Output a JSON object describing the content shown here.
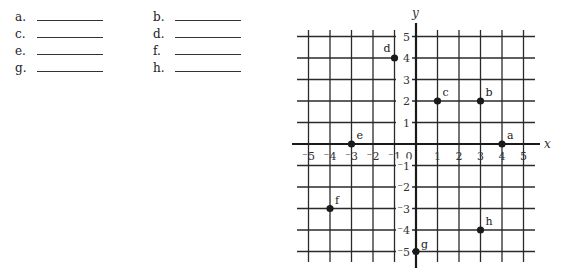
{
  "answers": [
    {
      "label": "a.",
      "value": ""
    },
    {
      "label": "b.",
      "value": ""
    },
    {
      "label": "c.",
      "value": ""
    },
    {
      "label": "d.",
      "value": ""
    },
    {
      "label": "e.",
      "value": ""
    },
    {
      "label": "f.",
      "value": ""
    },
    {
      "label": "g.",
      "value": ""
    },
    {
      "label": "h.",
      "value": ""
    }
  ],
  "graph": {
    "x_axis_label": "x",
    "y_axis_label": "y",
    "origin_label": "0",
    "x_ticks": [
      "⁻5",
      "⁻4",
      "⁻3",
      "⁻2",
      "⁻1",
      "1",
      "2",
      "3",
      "4",
      "5"
    ],
    "y_ticks": [
      "5",
      "4",
      "3",
      "2",
      "1",
      "⁻1",
      "⁻2",
      "⁻3",
      "⁻4",
      "⁻5"
    ],
    "points": [
      {
        "label": "a",
        "x": 4,
        "y": 0
      },
      {
        "label": "b",
        "x": 3,
        "y": 2
      },
      {
        "label": "c",
        "x": 1,
        "y": 2
      },
      {
        "label": "d",
        "x": -1,
        "y": 4
      },
      {
        "label": "e",
        "x": -3,
        "y": 0
      },
      {
        "label": "f",
        "x": -4,
        "y": -3
      },
      {
        "label": "g",
        "x": 0,
        "y": -5
      },
      {
        "label": "h",
        "x": 3,
        "y": -4
      }
    ]
  }
}
